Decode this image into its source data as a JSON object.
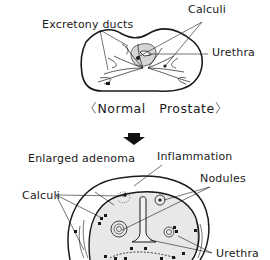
{
  "normal": {
    "caption": "Normal   Prostate",
    "bracket_left": "〈",
    "bracket_right": "〉",
    "labels": {
      "excretory_ducts": "Excretony ducts",
      "calculi": "Calculi",
      "urethra": "Urethra"
    }
  },
  "transition": {
    "arrow": "down-arrow"
  },
  "enlarged": {
    "labels": {
      "enlarged_adenoma": "Enlarged adenoma",
      "inflammation": "Inflammation",
      "nodules": "Nodules",
      "calculi": "Calculi",
      "urethra": "Urethra"
    }
  },
  "colors": {
    "line": "#1a1a1a",
    "fill_tissue": "#e6e6e6",
    "fill_urethra_area": "#d0d0d0",
    "background": "#ffffff"
  }
}
